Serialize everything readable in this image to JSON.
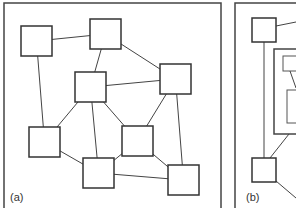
{
  "panels": [
    {
      "id": "a",
      "label": "(a)",
      "frame": {
        "x": 4,
        "y": 3,
        "w": 217,
        "h": 210
      },
      "nodes": [
        {
          "id": "n1",
          "x": 21,
          "y": 26,
          "w": 31,
          "h": 30
        },
        {
          "id": "n2",
          "x": 90,
          "y": 19,
          "w": 31,
          "h": 30
        },
        {
          "id": "n3",
          "x": 75,
          "y": 72,
          "w": 31,
          "h": 30
        },
        {
          "id": "n4",
          "x": 160,
          "y": 64,
          "w": 31,
          "h": 30
        },
        {
          "id": "n5",
          "x": 29,
          "y": 127,
          "w": 31,
          "h": 30
        },
        {
          "id": "n6",
          "x": 122,
          "y": 126,
          "w": 31,
          "h": 30
        },
        {
          "id": "n7",
          "x": 83,
          "y": 158,
          "w": 31,
          "h": 30
        },
        {
          "id": "n8",
          "x": 168,
          "y": 165,
          "w": 31,
          "h": 30
        }
      ],
      "edges": [
        [
          "n1",
          "n2"
        ],
        [
          "n1",
          "n5"
        ],
        [
          "n2",
          "n3"
        ],
        [
          "n2",
          "n4"
        ],
        [
          "n3",
          "n4"
        ],
        [
          "n3",
          "n5"
        ],
        [
          "n3",
          "n7"
        ],
        [
          "n3",
          "n6"
        ],
        [
          "n4",
          "n6"
        ],
        [
          "n4",
          "n8"
        ],
        [
          "n5",
          "n7"
        ],
        [
          "n6",
          "n7"
        ],
        [
          "n6",
          "n8"
        ],
        [
          "n7",
          "n8"
        ]
      ]
    },
    {
      "id": "b",
      "label": "(b)",
      "frame": {
        "x": 235,
        "y": 3,
        "w": 70,
        "h": 210
      },
      "nodes": [
        {
          "id": "m1",
          "x": 252,
          "y": 18,
          "w": 24,
          "h": 24
        },
        {
          "id": "m2",
          "x": 252,
          "y": 158,
          "w": 24,
          "h": 24
        }
      ],
      "group": {
        "x": 274,
        "y": 49,
        "w": 30,
        "h": 85
      },
      "inner_nodes": [
        {
          "id": "g1",
          "x": 283,
          "y": 56,
          "w": 20,
          "h": 15
        },
        {
          "id": "g2",
          "x": 287,
          "y": 90,
          "w": 16,
          "h": 33
        }
      ]
    }
  ]
}
